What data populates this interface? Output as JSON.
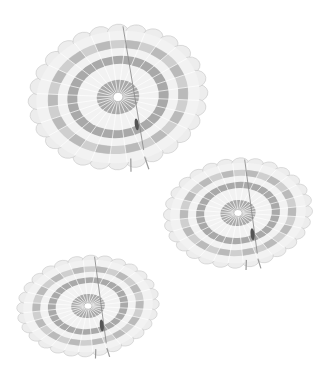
{
  "scene": {
    "description": "Three round parachutes descending against a white sky",
    "background": "#ffffff",
    "colors": {
      "light_panel": "#f2f2f2",
      "dark_panel": "#a9a9a9",
      "mid_panel": "#cfcfcf",
      "line": "#8a8a8a",
      "vent": "#ffffff"
    },
    "parachutes": [
      {
        "name": "parachute-top",
        "cx": 118,
        "cy": 97,
        "rx": 82,
        "ry": 66,
        "rotate": -8
      },
      {
        "name": "parachute-middle",
        "cx": 238,
        "cy": 213,
        "rx": 68,
        "ry": 50,
        "rotate": -6
      },
      {
        "name": "parachute-bottom",
        "cx": 88,
        "cy": 306,
        "rx": 65,
        "ry": 46,
        "rotate": -6
      }
    ]
  }
}
